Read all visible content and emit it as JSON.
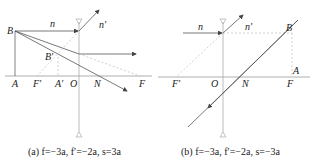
{
  "panel_a": {
    "labels": {
      "B": "B",
      "n": "n",
      "n_prime": "n'",
      "B_prime": "B'",
      "A": "A",
      "F_prime": "F'",
      "A_prime": "A'",
      "O": "O",
      "N": "N",
      "F": "F"
    },
    "caption": "(a) f=−3a, f′=−2a, s=3a"
  },
  "panel_b": {
    "labels": {
      "n": "n",
      "n_prime": "n'",
      "B": "B",
      "A": "A",
      "F_prime": "F'",
      "O": "O",
      "N": "N",
      "F": "F"
    },
    "caption": "(b) f=−3a, f′=−2a, s=−3a"
  },
  "colors": {
    "line": "#555555",
    "dashed": "#bbbbbb",
    "axis": "#999999"
  }
}
